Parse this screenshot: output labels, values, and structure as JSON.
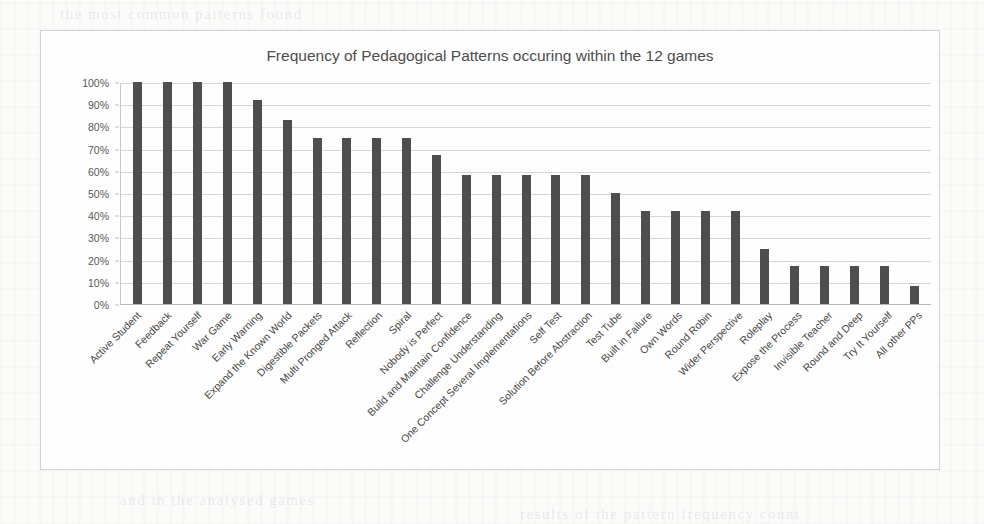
{
  "chart_data": {
    "type": "bar",
    "title": "Frequency of Pedagogical Patterns occuring within the 12 games",
    "xlabel": "",
    "ylabel": "",
    "ylim": [
      0,
      100
    ],
    "ytick_labels": [
      "100%",
      "90%",
      "80%",
      "70%",
      "60%",
      "50%",
      "40%",
      "30%",
      "20%",
      "10%",
      "0%"
    ],
    "ytick_values": [
      100,
      90,
      80,
      70,
      60,
      50,
      40,
      30,
      20,
      10,
      0
    ],
    "grid": true,
    "legend": false,
    "bar_color": "#4e4e4e",
    "categories": [
      "Active Student",
      "Feedback",
      "Repeat Yourself",
      "War Game",
      "Early Warning",
      "Expand the Known World",
      "Digestible Packets",
      "Multi Pronged Attack",
      "Reflection",
      "Spiral",
      "Nobody is Perfect",
      "Build and Maintain Confidence",
      "Challenge Understanding",
      "One Concept Several Implementations",
      "Self Test",
      "Solution Before Abstraction",
      "Test Tube",
      "Built in Failure",
      "Own Words",
      "Round Robin",
      "Wider Perspective",
      "Roleplay",
      "Expose the Process",
      "Invisible Teacher",
      "Round and Deep",
      "Try It Yourself",
      "All other PPs"
    ],
    "values": [
      100,
      100,
      100,
      100,
      92,
      83,
      75,
      75,
      75,
      75,
      67,
      58,
      58,
      58,
      58,
      58,
      50,
      42,
      42,
      42,
      42,
      25,
      17,
      17,
      17,
      17,
      8
    ]
  },
  "background": {
    "bleed_lines": [
      "the  most  common  patterns  found",
      "and  in  the  analysed  games",
      "results  of  the  pattern  frequency  count"
    ]
  }
}
